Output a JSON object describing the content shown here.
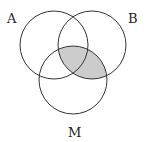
{
  "diagram": {
    "type": "venn",
    "sets": [
      {
        "label": "A",
        "cx": 54,
        "cy": 45,
        "r": 34
      },
      {
        "label": "B",
        "cx": 92,
        "cy": 45,
        "r": 34
      },
      {
        "label": "M",
        "cx": 73,
        "cy": 80,
        "r": 34
      }
    ],
    "shaded_region": "B ∩ M",
    "shade_color": "#cccccc",
    "stroke_color": "#333333"
  },
  "labels": {
    "a": "A",
    "b": "B",
    "m": "M"
  }
}
